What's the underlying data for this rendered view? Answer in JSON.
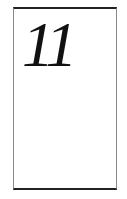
{
  "card": {
    "number": "11"
  },
  "colors": {
    "border_dark": "#222222",
    "border_side": "#8a8a8a",
    "text": "#111111",
    "background": "#ffffff"
  }
}
